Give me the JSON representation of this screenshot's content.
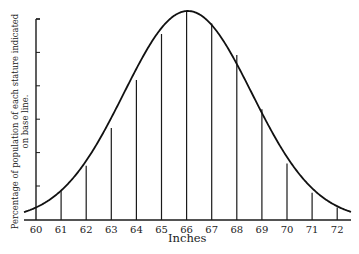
{
  "chart_data": {
    "type": "line",
    "title": "",
    "xlabel": "Inches",
    "ylabel_line1": "Percentage of population of each stature indicated",
    "ylabel_line2": "on base line.",
    "x": [
      60,
      61,
      62,
      63,
      64,
      65,
      66,
      67,
      68,
      69,
      70,
      71,
      72
    ],
    "categories": [
      "60",
      "61",
      "62",
      "63",
      "64",
      "65",
      "66",
      "67",
      "68",
      "69",
      "70",
      "71",
      "72"
    ],
    "series": [
      {
        "name": "Stature distribution (relative height, % of peak)",
        "values": [
          7,
          14,
          26,
          44,
          67,
          89,
          100,
          94,
          79,
          53,
          27,
          13,
          6
        ]
      }
    ],
    "y_ticks_count": 6,
    "y_tick_labels": [],
    "grid": false,
    "legend": "none"
  },
  "colors": {
    "ink": "#1a1a1a",
    "background": "#ffffff"
  }
}
